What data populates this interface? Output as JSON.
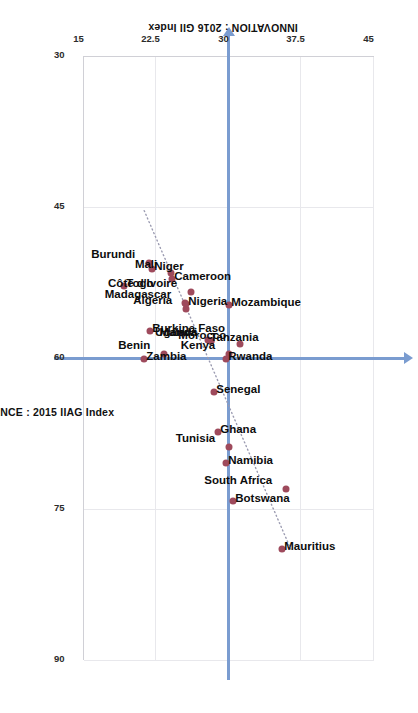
{
  "chart_data": {
    "type": "scatter",
    "title": "",
    "xlabel": "GOVERNANCE : 2015 IIAG Index",
    "ylabel": "INNOVATION : 2016 GII Index",
    "xlim": [
      30,
      90
    ],
    "ylim": [
      15,
      45
    ],
    "xticks": [
      "30",
      "45",
      "60",
      "75",
      "90"
    ],
    "xtick_values": [
      30,
      45,
      60,
      75,
      90
    ],
    "yticks": [
      "15",
      "22.5",
      "30",
      "37.5",
      "45"
    ],
    "ytick_values": [
      15,
      22.5,
      30,
      37.5,
      45
    ],
    "grid": true,
    "legend": "none",
    "reference_lines": {
      "vertical_x": 60,
      "horizontal_y": 30,
      "color": "#7a9cd0",
      "style": "solid-with-arrowheads"
    },
    "trendline": {
      "style": "dotted",
      "color": "#9a9ab0",
      "x_start": 79.0,
      "y_start": 36.4,
      "x_end": 45.3,
      "y_end": 21.2
    },
    "marker_color": "#9e4a5c",
    "points": [
      {
        "label": "Mauritius",
        "x": 79.0,
        "y": 35.5,
        "label_pos": "right"
      },
      {
        "label": "South Africa",
        "x": 73.0,
        "y": 35.9,
        "label_pos": "left"
      },
      {
        "label": "Botswana",
        "x": 74.2,
        "y": 30.4,
        "label_pos": "right"
      },
      {
        "label": "Namibia",
        "x": 70.4,
        "y": 29.7,
        "label_pos": "right"
      },
      {
        "label": "Tunisia",
        "x": 68.8,
        "y": 30.0,
        "label_pos": "left"
      },
      {
        "label": "Ghana",
        "x": 67.4,
        "y": 28.9,
        "label_pos": "right"
      },
      {
        "label": "Senegal",
        "x": 63.4,
        "y": 28.4,
        "label_pos": "right"
      },
      {
        "label": "Rwanda",
        "x": 60.1,
        "y": 29.7,
        "label_pos": "right"
      },
      {
        "label": "Kenya",
        "x": 59.6,
        "y": 30.0,
        "label_pos": "left"
      },
      {
        "label": "Morocco",
        "x": 58.6,
        "y": 31.1,
        "label_pos": "left"
      },
      {
        "label": "Mozambique",
        "x": 54.7,
        "y": 30.0,
        "label_pos": "right"
      },
      {
        "label": "Uganda",
        "x": 58.3,
        "y": 28.1,
        "label_pos": "left"
      },
      {
        "label": "Malawi",
        "x": 58.3,
        "y": 28.1,
        "label_pos": "left"
      },
      {
        "label": "Tanzania",
        "x": 58.2,
        "y": 27.8,
        "label_pos": "right"
      },
      {
        "label": "Benin",
        "x": 59.6,
        "y": 23.3,
        "label_pos": "left"
      },
      {
        "label": "Zambia",
        "x": 60.1,
        "y": 21.2,
        "label_pos": "right"
      },
      {
        "label": "Algeria",
        "x": 55.1,
        "y": 25.6,
        "label_pos": "left"
      },
      {
        "label": "Nigeria",
        "x": 54.6,
        "y": 25.6,
        "label_pos": "right"
      },
      {
        "label": "Madagascar",
        "x": 54.5,
        "y": 25.4,
        "label_pos": "left"
      },
      {
        "label": "Côte d'Ivoire",
        "x": 53.4,
        "y": 26.1,
        "label_pos": "left"
      },
      {
        "label": "Burkina Faso",
        "x": 57.3,
        "y": 21.8,
        "label_pos": "right"
      },
      {
        "label": "Cameroon",
        "x": 52.2,
        "y": 24.1,
        "label_pos": "right"
      },
      {
        "label": "Mali",
        "x": 51.6,
        "y": 24.0,
        "label_pos": "left"
      },
      {
        "label": "Niger",
        "x": 51.2,
        "y": 22.0,
        "label_pos": "right"
      },
      {
        "label": "Burundi",
        "x": 50.6,
        "y": 21.7,
        "label_pos": "left"
      },
      {
        "label": "Togo",
        "x": 52.8,
        "y": 19.1,
        "label_pos": "right"
      }
    ]
  }
}
